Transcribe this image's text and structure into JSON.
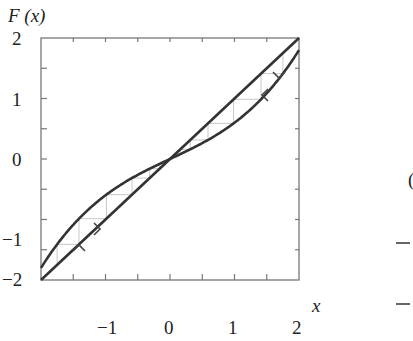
{
  "chart_data": {
    "type": "line",
    "title": "",
    "xlabel": "x",
    "ylabel": "F (x)",
    "xlim": [
      -2,
      2
    ],
    "ylim": [
      -2,
      2
    ],
    "x_ticks": [
      -1,
      0,
      1,
      2
    ],
    "x_tick_labels": [
      "−1",
      "0",
      "1",
      "2"
    ],
    "x_minor_ticks": [
      -1.5,
      -1,
      -0.5,
      0,
      0.5,
      1,
      1.5
    ],
    "y_ticks": [
      -2,
      -1,
      0,
      1,
      2
    ],
    "y_tick_labels": [
      "−2",
      "−1",
      "0",
      "1",
      "2"
    ],
    "y_minor_ticks": [
      -1.5,
      -1,
      -0.5,
      0,
      0.5,
      1,
      1.5
    ],
    "grid": false,
    "legend": null,
    "series": [
      {
        "name": "F(x) = x",
        "kind": "diagonal",
        "x": [
          -2,
          2
        ],
        "y": [
          -2,
          2
        ]
      },
      {
        "name": "F(x) cubic map",
        "kind": "curve",
        "formula": "0.5x + 0.1x^3",
        "x": [
          -2,
          -1.5,
          -1,
          -0.5,
          0,
          0.5,
          1,
          1.5,
          2
        ],
        "y": [
          -1.8,
          -1.09,
          -0.6,
          -0.26,
          0,
          0.26,
          0.6,
          1.09,
          1.8
        ]
      }
    ],
    "cobweb": [
      {
        "name": "left orbit",
        "start_x": -1.75,
        "direction": "toward 0 from below",
        "arrows": [
          "up",
          "right"
        ]
      },
      {
        "name": "right orbit",
        "start_x": 1.75,
        "direction": "toward 0 from above",
        "arrows": [
          "down",
          "left"
        ]
      }
    ],
    "annotations": [
      {
        "text": "›",
        "meaning": "arrow indicating orbit direction (right)",
        "x": -1.2,
        "y": -0.95
      },
      {
        "text": "˄",
        "meaning": "arrow indicating orbit direction (up)",
        "x": -1.55,
        "y": -1.25
      },
      {
        "text": "‹",
        "meaning": "arrow indicating orbit direction (left)",
        "x": 1.2,
        "y": 1.25
      },
      {
        "text": "˅",
        "meaning": "arrow indicating orbit direction (down)",
        "x": 1.55,
        "y": 1.5
      }
    ]
  },
  "labels": {
    "y_axis_title": "F (x)",
    "x_axis_title": "x",
    "y_ticks": [
      "2",
      "1",
      "0",
      "−1",
      "−2"
    ],
    "x_ticks": [
      "−1",
      "0",
      "1",
      "2"
    ]
  },
  "neighbor_panel": {
    "partial_tick_labels": [
      "(",
      "−",
      "−"
    ]
  }
}
